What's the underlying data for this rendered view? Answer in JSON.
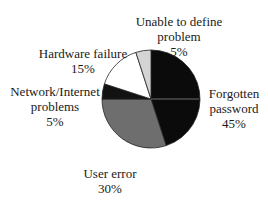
{
  "chart_data": {
    "type": "pie",
    "title": "",
    "categories": [
      "Forgotten password",
      "User error",
      "Network/Internet problems",
      "Hardware failure",
      "Unable to define problem"
    ],
    "values": [
      45,
      30,
      5,
      15,
      5
    ],
    "unit": "%",
    "colors": [
      "#0b0b0b",
      "#6e6e6e",
      "#121212",
      "#ffffff",
      "#d4d4d4"
    ],
    "start_angle": "12 o'clock, clockwise",
    "legend": "none (direct labels)"
  },
  "labels": {
    "forgotten": {
      "line1": "Forgotten",
      "line2": "password",
      "pct": "45%"
    },
    "user_error": {
      "line1": "User error",
      "pct": "30%"
    },
    "network": {
      "line1": "Network/Internet",
      "line2": "problems",
      "pct": "5%"
    },
    "hardware": {
      "line1": "Hardware failure",
      "pct": "15%"
    },
    "unable": {
      "line1": "Unable to define",
      "line2": "problem",
      "pct": "5%"
    }
  }
}
